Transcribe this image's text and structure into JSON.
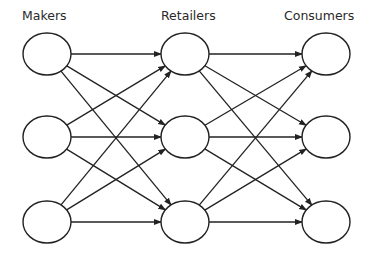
{
  "diagram": {
    "type": "network-flow",
    "columns": [
      {
        "id": "makers",
        "label": "Makers",
        "label_x": 22,
        "cx": 47,
        "nodes": 3
      },
      {
        "id": "retailers",
        "label": "Retailers",
        "label_x": 161,
        "cx": 185,
        "nodes": 3
      },
      {
        "id": "consumers",
        "label": "Consumers",
        "label_x": 284,
        "cx": 326,
        "nodes": 3
      }
    ],
    "row_y": [
      54,
      137,
      222
    ],
    "node_rx": 24,
    "node_ry": 21,
    "edges": "complete bipartite: each Makers node -> each Retailers node; each Retailers node -> each Consumers node",
    "stroke_color": "#222222"
  }
}
